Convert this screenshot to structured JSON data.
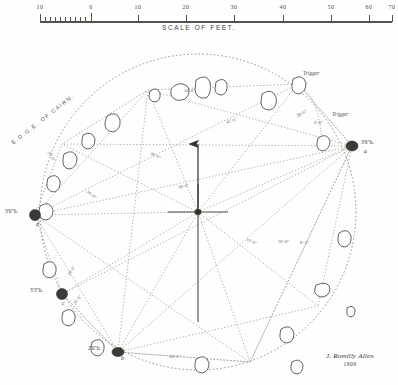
{
  "document": {
    "kind": "survey-plan",
    "title": "Stone circle survey plan",
    "signature": "J. Romilly Allen",
    "date": "1909"
  },
  "scale": {
    "title": "SCALE OF FEET.",
    "ticks": [
      {
        "label": "10",
        "x": 40
      },
      {
        "label": "0",
        "x": 91
      },
      {
        "label": "10",
        "x": 138
      },
      {
        "label": "20",
        "x": 186
      },
      {
        "label": "30",
        "x": 234
      },
      {
        "label": "40",
        "x": 283
      },
      {
        "label": "50",
        "x": 331
      },
      {
        "label": "60",
        "x": 369
      },
      {
        "label": "70",
        "x": 392
      }
    ],
    "subdivisions": 10
  },
  "annotations": {
    "edge_of_cairn": "E.D.G.E. OF CAIRN.",
    "trigger_upper": "Trigger",
    "trigger_lower": "Trigger",
    "north_arrow": "north-arrow"
  },
  "stones": [
    {
      "id": "a",
      "height": "3'6\"h.",
      "x": 352,
      "y": 146
    },
    {
      "id": "b",
      "height": "2'0\"h.",
      "x": 118,
      "y": 352
    },
    {
      "id": "c",
      "height": "3'3\"h.",
      "x": 62,
      "y": 294
    },
    {
      "id": "d",
      "height": "3'0\"h.",
      "x": 35,
      "y": 215
    }
  ],
  "measurements": [
    {
      "value": "34'-0\"",
      "x": 196,
      "y": 92
    },
    {
      "value": "41'-6\"",
      "x": 238,
      "y": 122
    },
    {
      "value": "28'-6\"",
      "x": 305,
      "y": 115
    },
    {
      "value": "6'-0\"",
      "x": 321,
      "y": 128
    },
    {
      "value": "33'-6\"",
      "x": 58,
      "y": 158
    },
    {
      "value": "36'-0\"",
      "x": 162,
      "y": 157
    },
    {
      "value": "78'-6\"",
      "x": 190,
      "y": 188
    },
    {
      "value": "34'-0\"",
      "x": 97,
      "y": 196
    },
    {
      "value": "35'-0\"",
      "x": 258,
      "y": 243
    },
    {
      "value": "36'-0\"",
      "x": 289,
      "y": 243
    },
    {
      "value": "8'-3\"",
      "x": 309,
      "y": 244
    },
    {
      "value": "30'-0\"",
      "x": 77,
      "y": 272
    },
    {
      "value": "26'-6\"",
      "x": 83,
      "y": 301
    },
    {
      "value": "28'-1\"",
      "x": 181,
      "y": 358
    }
  ],
  "colors": {
    "ink": "#3a3a38",
    "line": "#55524e",
    "dotted": "#8b8780",
    "paper": "#fefefe",
    "stone_fill": "#3c3a36"
  }
}
